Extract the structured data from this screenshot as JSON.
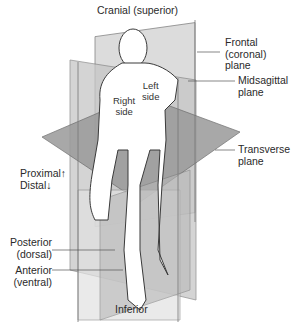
{
  "diagram": {
    "labels": {
      "cranial": "Cranial (superior)",
      "frontal_1": "Frontal",
      "frontal_2": "(coronal)",
      "frontal_3": "plane",
      "midsagittal_1": "Midsagittal",
      "midsagittal_2": "plane",
      "left_1": "Left",
      "left_2": "side",
      "right_1": "Right",
      "right_2": "side",
      "transverse_1": "Transverse",
      "transverse_2": "plane",
      "proximal": "Proximal↑",
      "distal": "Distal↓",
      "posterior_1": "Posterior",
      "posterior_2": "(dorsal)",
      "anterior_1": "Anterior",
      "anterior_2": "(ventral)",
      "inferior": "Inferior"
    },
    "colors": {
      "plane_light": "#d9d9d9",
      "plane_mid": "#bdbdbd",
      "plane_dark": "#8c8c8c",
      "body": "#ffffff",
      "outline": "#3a3a3a",
      "leader": "#555555"
    }
  }
}
